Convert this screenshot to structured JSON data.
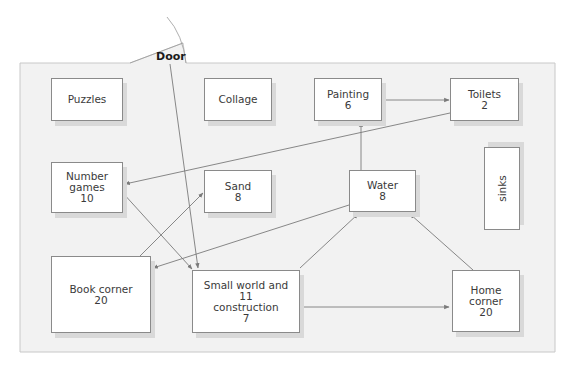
{
  "diagram": {
    "type": "classroom floor plan with movement arrows",
    "door_label": "Door",
    "colors": {
      "room_fill": "#f2f2f2",
      "room_border": "#c8c8c8",
      "box_border": "#8a8a8a",
      "box_shadow": "#d9d9d9",
      "arrow": "#7a7a7a",
      "text": "#3a3a3a"
    },
    "areas": [
      {
        "id": "puzzles",
        "lines": [
          "Puzzles"
        ]
      },
      {
        "id": "collage",
        "lines": [
          "Collage"
        ]
      },
      {
        "id": "painting",
        "lines": [
          "Painting",
          "6"
        ]
      },
      {
        "id": "toilets",
        "lines": [
          "Toilets",
          "2"
        ]
      },
      {
        "id": "number-games",
        "lines": [
          "Number",
          "games",
          "10"
        ]
      },
      {
        "id": "sand",
        "lines": [
          "Sand",
          "8"
        ]
      },
      {
        "id": "water",
        "lines": [
          "Water",
          "8"
        ]
      },
      {
        "id": "sinks",
        "lines": [
          "sinks"
        ]
      },
      {
        "id": "book-corner",
        "lines": [
          "Book corner",
          "20"
        ]
      },
      {
        "id": "small-world",
        "lines": [
          "Small world and",
          "11",
          "construction",
          "7"
        ]
      },
      {
        "id": "home-corner",
        "lines": [
          "Home",
          "corner",
          "20"
        ]
      }
    ],
    "arrows": [
      {
        "from": "Door",
        "to": "Small world and construction"
      },
      {
        "from": "Painting",
        "to": "Toilets"
      },
      {
        "from": "Water",
        "to": "Painting"
      },
      {
        "from": "Toilets",
        "to": "Number games"
      },
      {
        "from": "Number games",
        "to": "Small world and construction"
      },
      {
        "from": "Book corner",
        "to": "Sand"
      },
      {
        "from": "Water",
        "to": "Book corner"
      },
      {
        "from": "Small world and construction",
        "to": "Water"
      },
      {
        "from": "Home corner",
        "to": "Water"
      },
      {
        "from": "Small world and construction",
        "to": "Home corner"
      }
    ]
  }
}
